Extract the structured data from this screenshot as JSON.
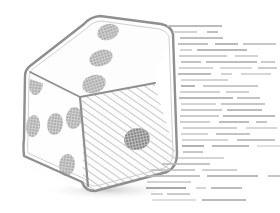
{
  "canvas": {
    "width": 280,
    "height": 213,
    "background_color": "#ffffff",
    "style": "grayscale line-art / halftone stipple illustration"
  },
  "illustration": {
    "subject_name": "dice",
    "alt_text": "Isometric line drawing of a single six-sided die with three faces visible",
    "outline_color": "#8f8f8f",
    "fill_color": "#fdfdfd",
    "pip_color": "#9a9a9a",
    "hatch_color": "#b5b5b5",
    "shadow_color": "#c8c8c8",
    "faces": [
      {
        "name": "top-face",
        "label": "Top face",
        "pip_count": 3,
        "shading": "plain",
        "pips": [
          {
            "cx": 108,
            "cy": 32,
            "rx": 11,
            "ry": 8,
            "rot": -18
          },
          {
            "cx": 101,
            "cy": 58,
            "rx": 12,
            "ry": 8,
            "rot": -18
          },
          {
            "cx": 94,
            "cy": 84,
            "rx": 12,
            "ry": 9,
            "rot": -18
          }
        ]
      },
      {
        "name": "left-face",
        "label": "Left face",
        "pip_count": 5,
        "shading": "plain",
        "pips": [
          {
            "cx": 36,
            "cy": 84,
            "rx": 7,
            "ry": 11,
            "rot": 8
          },
          {
            "cx": 33,
            "cy": 126,
            "rx": 7,
            "ry": 11,
            "rot": 8
          },
          {
            "cx": 55,
            "cy": 124,
            "rx": 8,
            "ry": 11,
            "rot": 8
          },
          {
            "cx": 74,
            "cy": 118,
            "rx": 8,
            "ry": 11,
            "rot": 8
          },
          {
            "cx": 67,
            "cy": 165,
            "rx": 8,
            "ry": 11,
            "rot": 8
          }
        ]
      },
      {
        "name": "right-face",
        "label": "Right face",
        "pip_count": 1,
        "shading": "diagonal-hatch",
        "pips": [
          {
            "cx": 137,
            "cy": 139,
            "rx": 13,
            "ry": 11,
            "rot": -12
          }
        ]
      }
    ],
    "total_visible_pips": 9
  },
  "text_panel": {
    "name": "wrapped-body-text",
    "legible": false,
    "description": "Dense block of unreadable placeholder body copy flowing to the right of and below the die, wrapping around its silhouette",
    "ink_color": "#b9b9b9",
    "line_height_px": 6,
    "columns": 2,
    "approx_line_count": 120,
    "region": {
      "x": 145,
      "y": 25,
      "width": 135,
      "height": 180
    }
  },
  "chart_data": null
}
